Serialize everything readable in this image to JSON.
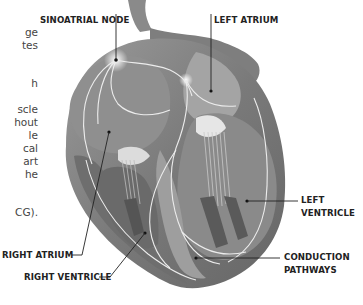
{
  "diagram": {
    "colors": {
      "heart_dark": "#5e5e5e",
      "heart_mid": "#8a8a8a",
      "heart_light": "#c8c8c8",
      "pathway": "#eaeaea",
      "label_text": "#222222",
      "body_text": "#444444"
    },
    "labels": {
      "sinoatrial_node": "SINOATRIAL NODE",
      "left_atrium": "LEFT ATRIUM",
      "left_ventricle_1": "LEFT",
      "left_ventricle_2": "VENTRICLE",
      "right_atrium": "RIGHT ATRIUM",
      "right_ventricle": "RIGHT VENTRICLE",
      "conduction_pathways_1": "CONDUCTION",
      "conduction_pathways_2": "PATHWAYS"
    }
  },
  "body_text_fragments": [
    "ge",
    "tes",
    "h",
    "scle",
    "hout",
    "le",
    "cal",
    "art",
    "he",
    "CG)."
  ]
}
